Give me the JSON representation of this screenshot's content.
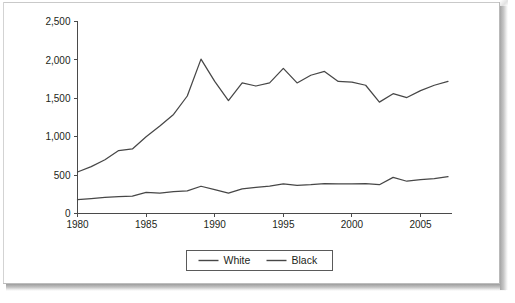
{
  "chart_data": {
    "type": "line",
    "title": "",
    "subtitle": "",
    "xlabel": "",
    "ylabel": "",
    "xlim": [
      1980,
      2007
    ],
    "ylim": [
      0,
      2500
    ],
    "grid": false,
    "legend_position": "bottom-center",
    "x": [
      1980,
      1981,
      1982,
      1983,
      1984,
      1985,
      1986,
      1987,
      1988,
      1989,
      1990,
      1991,
      1992,
      1993,
      1994,
      1995,
      1996,
      1997,
      1998,
      1999,
      2000,
      2001,
      2002,
      2003,
      2004,
      2005,
      2006,
      2007
    ],
    "y_ticks": [
      0,
      500,
      1000,
      1500,
      2000,
      2500
    ],
    "y_tick_labels": [
      "0",
      "500",
      "1,000",
      "1,500",
      "2,000",
      "2,500"
    ],
    "x_ticks": [
      1980,
      1985,
      1990,
      1995,
      2000,
      2005
    ],
    "x_tick_labels": [
      "1980",
      "1985",
      "1990",
      "1995",
      "2000",
      "2005"
    ],
    "series": [
      {
        "name": "White",
        "color": "#474747",
        "values": [
          540,
          610,
          700,
          820,
          840,
          1000,
          1140,
          1290,
          1530,
          2010,
          1720,
          1470,
          1700,
          1660,
          1700,
          1890,
          1700,
          1800,
          1850,
          1720,
          1710,
          1670,
          1450,
          1560,
          1510,
          1600,
          1670,
          1720
        ]
      },
      {
        "name": "Black",
        "color": "#474747",
        "values": [
          180,
          195,
          210,
          220,
          225,
          275,
          265,
          285,
          295,
          355,
          310,
          265,
          320,
          340,
          355,
          385,
          365,
          375,
          390,
          385,
          385,
          390,
          375,
          470,
          420,
          440,
          455,
          480
        ]
      }
    ]
  },
  "legend": {
    "items": [
      {
        "label": "White",
        "marker": "line-swatch"
      },
      {
        "label": "Black",
        "marker": "line-swatch"
      }
    ]
  },
  "axes": {
    "y_axis_name": "value-axis",
    "x_axis_name": "year-axis"
  }
}
